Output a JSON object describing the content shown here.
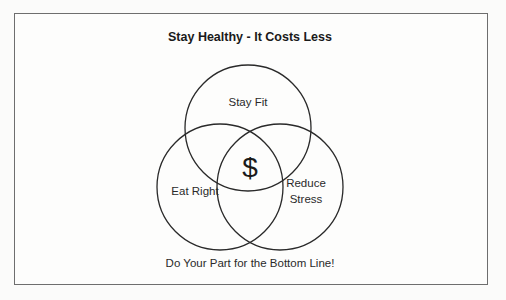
{
  "diagram": {
    "title": "Stay Healthy - It Costs Less",
    "circles": [
      {
        "label": "Stay Fit",
        "cx": 248,
        "cy": 128,
        "r": 63
      },
      {
        "label": "Eat Right",
        "cx": 220,
        "cy": 187,
        "r": 63
      },
      {
        "label_line1": "Reduce",
        "label_line2": "Stress",
        "cx": 280,
        "cy": 187,
        "r": 63
      }
    ],
    "center_symbol": "$",
    "footer": "Do Your Part for the Bottom Line!",
    "colors": {
      "stroke": "#2a2a2a",
      "border": "#6e6e6e",
      "background": "#fdfdfc"
    }
  }
}
